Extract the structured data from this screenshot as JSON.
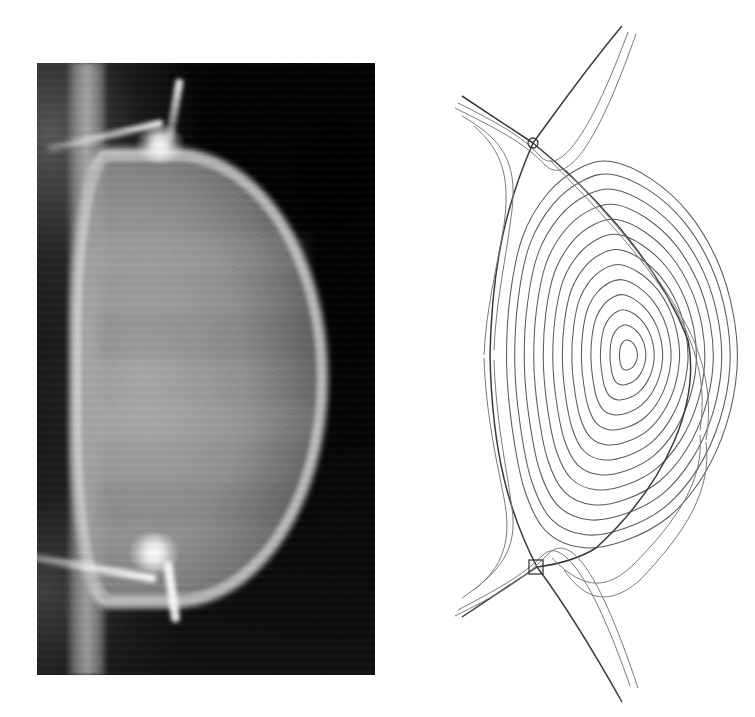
{
  "figure": {
    "caption": "",
    "background_color": "#ffffff",
    "width": 755,
    "height": 717,
    "panel_count": 2
  },
  "photo_panel": {
    "name": "plasma-photograph",
    "description": "Visible-light camera image of a double-null divertor plasma",
    "frame": {
      "x": 37,
      "y": 63,
      "width": 338,
      "height": 612
    },
    "background_color": "#0a0a0a",
    "plasma_color": "#b0b0b0",
    "separatrix_color": "#ffffff",
    "features": [
      {
        "name": "centre-column",
        "label": "centre column",
        "x": 66,
        "y": 300
      },
      {
        "name": "upper-x-point",
        "label": "upper X-point",
        "x": 160,
        "y": 148
      },
      {
        "name": "lower-x-point",
        "label": "lower X-point",
        "x": 152,
        "y": 555
      },
      {
        "name": "plasma-core",
        "label": "plasma core",
        "x": 200,
        "y": 360
      },
      {
        "name": "upper-divertor-leg",
        "label": "upper divertor leg",
        "x": 178,
        "y": 95
      },
      {
        "name": "lower-divertor-leg",
        "label": "lower divertor leg",
        "x": 175,
        "y": 607
      }
    ]
  },
  "flux_panel": {
    "name": "flux-surface-plot",
    "description": "Reconstructed poloidal magnetic flux surfaces, double-null configuration",
    "frame": {
      "x": 400,
      "y": 10,
      "width": 345,
      "height": 700
    },
    "line_color": "#5b5b5b",
    "separatrix_color": "#3a3a3a",
    "magnetic_axis": {
      "x": 615,
      "y": 355
    },
    "upper_x_point": {
      "x": 533,
      "y": 143,
      "marker": "circle"
    },
    "lower_x_point": {
      "x": 537,
      "y": 567,
      "marker": "square"
    },
    "contour_count": 15
  },
  "chart_data": {
    "type": "line",
    "xlabel": "R",
    "ylabel": "Z",
    "grid": false,
    "legend": "none",
    "xlim": [
      0,
      345
    ],
    "ylim": [
      0,
      700
    ],
    "annotations": [
      {
        "label": "upper X-point",
        "x": 133,
        "y": 133
      },
      {
        "label": "lower X-point",
        "x": 137,
        "y": 557
      },
      {
        "label": "magnetic axis",
        "x": 215,
        "y": 345
      }
    ],
    "series": [
      {
        "name": "closed-flux-surface-01",
        "kind": "closed",
        "scale": 0.07
      },
      {
        "name": "closed-flux-surface-02",
        "kind": "closed",
        "scale": 0.14
      },
      {
        "name": "closed-flux-surface-03",
        "kind": "closed",
        "scale": 0.21
      },
      {
        "name": "closed-flux-surface-04",
        "kind": "closed",
        "scale": 0.28
      },
      {
        "name": "closed-flux-surface-05",
        "kind": "closed",
        "scale": 0.35
      },
      {
        "name": "closed-flux-surface-06",
        "kind": "closed",
        "scale": 0.42
      },
      {
        "name": "closed-flux-surface-07",
        "kind": "closed",
        "scale": 0.49
      },
      {
        "name": "closed-flux-surface-08",
        "kind": "closed",
        "scale": 0.56
      },
      {
        "name": "closed-flux-surface-09",
        "kind": "closed",
        "scale": 0.63
      },
      {
        "name": "closed-flux-surface-10",
        "kind": "closed",
        "scale": 0.7
      },
      {
        "name": "closed-flux-surface-11",
        "kind": "closed",
        "scale": 0.77
      },
      {
        "name": "closed-flux-surface-12",
        "kind": "closed",
        "scale": 0.84
      },
      {
        "name": "closed-flux-surface-13",
        "kind": "closed",
        "scale": 0.9
      },
      {
        "name": "separatrix",
        "kind": "separatrix",
        "scale": 1.0
      },
      {
        "name": "open-flux-surface-sol-1",
        "kind": "open",
        "scale": 1.06
      },
      {
        "name": "open-flux-surface-sol-2",
        "kind": "open",
        "scale": 1.13
      }
    ]
  }
}
